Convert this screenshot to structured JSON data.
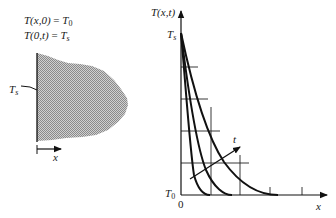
{
  "left_panel": {
    "conditions": [
      {
        "lhs": "T(x,0)",
        "eq": " = ",
        "rhs": "T",
        "rhs_sub": "0"
      },
      {
        "lhs": "T(0,t)",
        "eq": " = ",
        "rhs": "T",
        "rhs_sub": "s"
      }
    ],
    "surface_label": "T",
    "surface_label_sub": "s",
    "x_axis_label": "x"
  },
  "right_panel": {
    "y_axis_label": "T(x,t)",
    "ts_label": "T",
    "ts_sub": "s",
    "t0_label": "T",
    "t0_sub": "0",
    "origin_label": "0",
    "x_axis_label": "x",
    "time_arrow_label": "t"
  },
  "colors": {
    "line": "#111111",
    "solid_fill": "#b8b8b8"
  }
}
